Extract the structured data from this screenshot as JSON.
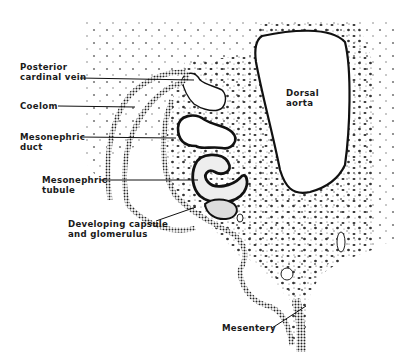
{
  "figure": {
    "colors": {
      "ink": "#1a1a1a",
      "background": "#ffffff",
      "stipple": "#2b2b2b"
    }
  },
  "labels": {
    "posterior_cardinal_vein": {
      "line1": "Posterior",
      "line2": "cardinal vein"
    },
    "coelom": {
      "line1": "Coelom"
    },
    "mesonephric_duct": {
      "line1": "Mesonephric",
      "line2": "duct"
    },
    "mesonephric_tubule": {
      "line1": "Mesonephric",
      "line2": "tubule"
    },
    "capsule_glomerulus": {
      "line1": "Developing capsule",
      "line2": "and glomerulus"
    },
    "dorsal_aorta": {
      "line1": "Dorsal",
      "line2": "aorta"
    },
    "mesentery": {
      "line1": "Mesentery"
    }
  }
}
